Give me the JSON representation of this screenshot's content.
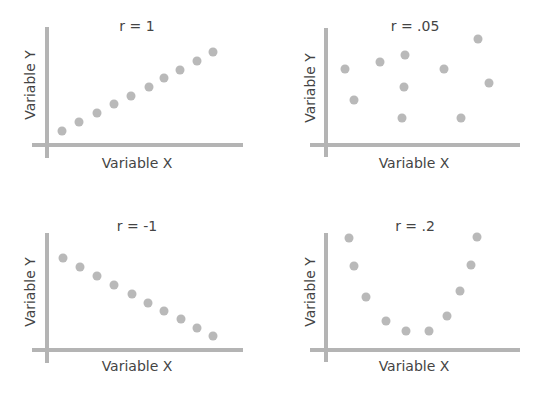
{
  "colors": {
    "axis": "#b4b4b4",
    "point": "#b9b9b9",
    "text": "#444444",
    "background": "#ffffff"
  },
  "chart_data": [
    {
      "type": "scatter",
      "title": "r = 1",
      "xlabel": "Variable X",
      "ylabel": "Variable Y",
      "grid": false,
      "layout": {
        "axis_x": 47,
        "axis_y": 145,
        "x_start": 32,
        "x_end": 243,
        "y_top": 27,
        "y_bottom": 158,
        "title_x": 137,
        "title_y": 18,
        "xlabel_x": 137,
        "xlabel_y": 155,
        "ylabel_x": 30,
        "ylabel_y": 85
      },
      "points": [
        [
          62,
          131
        ],
        [
          79,
          122
        ],
        [
          97,
          113
        ],
        [
          114,
          104
        ],
        [
          131,
          96
        ],
        [
          149,
          87
        ],
        [
          164,
          78
        ],
        [
          180,
          70
        ],
        [
          197,
          61
        ],
        [
          213,
          52
        ]
      ]
    },
    {
      "type": "scatter",
      "title": "r = .05",
      "xlabel": "Variable X",
      "ylabel": "Variable Y",
      "grid": false,
      "layout": {
        "axis_x": 326,
        "axis_y": 145,
        "x_start": 310,
        "x_end": 520,
        "y_top": 28,
        "y_bottom": 157,
        "title_x": 415,
        "title_y": 18,
        "xlabel_x": 414,
        "xlabel_y": 155,
        "ylabel_x": 310,
        "ylabel_y": 88
      },
      "points": [
        [
          345,
          69
        ],
        [
          354,
          100
        ],
        [
          380,
          62
        ],
        [
          405,
          55
        ],
        [
          404,
          87
        ],
        [
          402,
          118
        ],
        [
          444,
          69
        ],
        [
          478,
          39
        ],
        [
          461,
          118
        ],
        [
          489,
          83
        ]
      ]
    },
    {
      "type": "scatter",
      "title": "r = -1",
      "xlabel": "Variable X",
      "ylabel": "Variable Y",
      "grid": false,
      "layout": {
        "axis_x": 47,
        "axis_y": 350,
        "x_start": 32,
        "x_end": 243,
        "y_top": 233,
        "y_bottom": 363,
        "title_x": 137,
        "title_y": 218,
        "xlabel_x": 137,
        "xlabel_y": 358,
        "ylabel_x": 30,
        "ylabel_y": 292
      },
      "points": [
        [
          63,
          258
        ],
        [
          80,
          267
        ],
        [
          97,
          276
        ],
        [
          114,
          285
        ],
        [
          132,
          294
        ],
        [
          148,
          303
        ],
        [
          164,
          311
        ],
        [
          181,
          319
        ],
        [
          197,
          328
        ],
        [
          213,
          336
        ]
      ]
    },
    {
      "type": "scatter",
      "title": "r = .2",
      "xlabel": "Variable X",
      "ylabel": "Variable Y",
      "grid": false,
      "layout": {
        "axis_x": 326,
        "axis_y": 350,
        "x_start": 310,
        "x_end": 520,
        "y_top": 233,
        "y_bottom": 362,
        "title_x": 415,
        "title_y": 218,
        "xlabel_x": 414,
        "xlabel_y": 358,
        "ylabel_x": 310,
        "ylabel_y": 292
      },
      "points": [
        [
          349,
          238
        ],
        [
          354,
          266
        ],
        [
          366,
          297
        ],
        [
          386,
          321
        ],
        [
          406,
          331
        ],
        [
          429,
          331
        ],
        [
          447,
          316
        ],
        [
          460,
          291
        ],
        [
          471,
          265
        ],
        [
          477,
          237
        ]
      ]
    }
  ]
}
